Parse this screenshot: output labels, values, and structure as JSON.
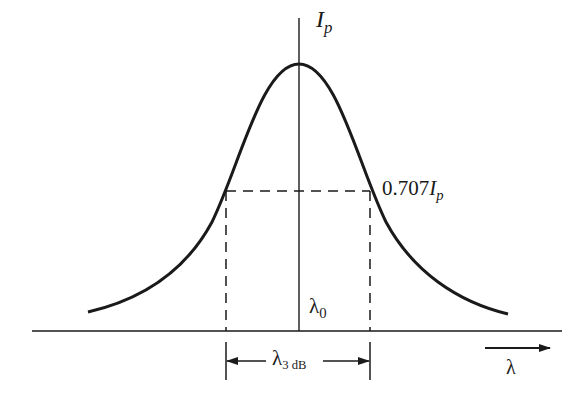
{
  "diagram": {
    "type": "gaussian-spectral-linewidth",
    "colors": {
      "ink": "#1a1a1a",
      "background": "#ffffff"
    },
    "labels": {
      "peak_symbol": "I",
      "peak_subscript": "p",
      "half_power_prefix": "0.707",
      "half_power_symbol": "I",
      "half_power_subscript": "p",
      "center_symbol": "λ",
      "center_subscript": "0",
      "width_symbol": "λ",
      "width_subscript": "3 dB",
      "axis_symbol": "λ"
    }
  }
}
